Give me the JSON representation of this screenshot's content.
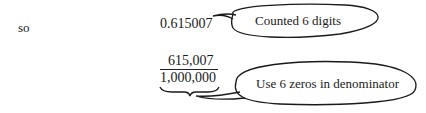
{
  "lines": {
    "lead_word": "so",
    "decimal_value": "0.615007",
    "fraction": {
      "numerator": "615,007",
      "denominator": "1,000,000"
    }
  },
  "callouts": [
    {
      "text": "Counted 6 digits"
    },
    {
      "text": "Use 6 zeros in denominator"
    }
  ],
  "colors": {
    "ink": "#1a1a1a",
    "background": "#ffffff"
  }
}
